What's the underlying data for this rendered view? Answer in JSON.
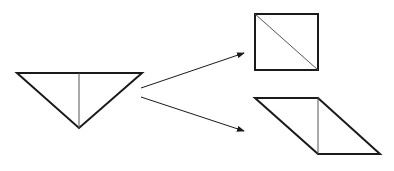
{
  "diagram": {
    "stroke_color": "#1a1a1a",
    "thin_stroke_color": "#555555",
    "shapes": {
      "triangle": {
        "points": "17,73 142,73 79,128",
        "divider": {
          "x1": 79,
          "y1": 73,
          "x2": 79,
          "y2": 128
        }
      },
      "square": {
        "x": 255,
        "y": 14,
        "width": 63,
        "height": 56,
        "diagonal": {
          "x1": 255,
          "y1": 14,
          "x2": 318,
          "y2": 70
        }
      },
      "parallelogram": {
        "points": "255,98 318,98 380,154 318,154",
        "divider": {
          "x1": 318,
          "y1": 98,
          "x2": 318,
          "y2": 154
        }
      }
    },
    "arrows": [
      {
        "name": "arrow-to-square",
        "x1": 141,
        "y1": 88,
        "x2": 244,
        "y2": 53
      },
      {
        "name": "arrow-to-parallelogram",
        "x1": 141,
        "y1": 97,
        "x2": 244,
        "y2": 131
      }
    ]
  }
}
